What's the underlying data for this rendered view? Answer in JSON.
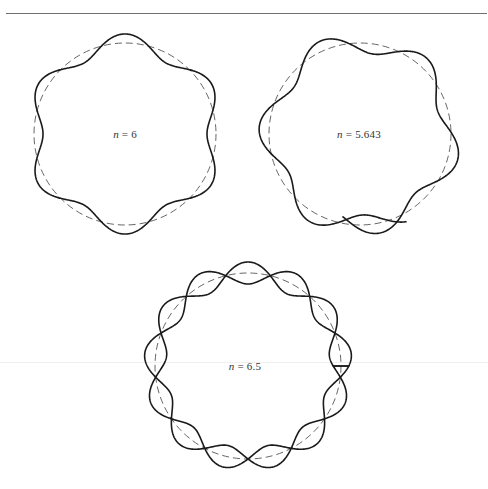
{
  "figures": [
    {
      "id": "n6",
      "label_var": "n",
      "label_eq": " = ",
      "label_value": "6",
      "n": 6,
      "center": [
        125,
        134
      ],
      "radius": 91,
      "amplitude": 9,
      "phase_deg": 90,
      "turns": 1,
      "start_deg": 0,
      "mode": "closed"
    },
    {
      "id": "n5643",
      "label_var": "n",
      "label_eq": " = ",
      "label_value": "5.643",
      "n": 5.643,
      "center": [
        360,
        134
      ],
      "radius": 91,
      "amplitude": 10,
      "phase_deg": 90,
      "start_deg": 258,
      "sweep_deg": 400,
      "mode": "open"
    },
    {
      "id": "n65",
      "label_var": "n",
      "label_eq": " = ",
      "label_value": "6.5",
      "n": 6.5,
      "center": [
        248,
        366
      ],
      "radius": 93,
      "amplitude": 11,
      "phase_deg": 90,
      "mode": "double"
    }
  ],
  "colors": {
    "wave": "#1a1a1a",
    "dashed_circle": "#555555",
    "rule": "#6f6f6f"
  }
}
